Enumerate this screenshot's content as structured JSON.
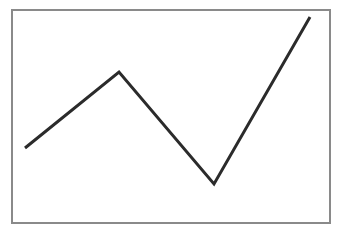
{
  "figure": {
    "title": "",
    "background_color": "#ffffff",
    "width": 343,
    "height": 232,
    "alt_text": "Line chart with a single dark zigzag series rising, falling, then rising sharply inside a thin gray rectangular frame."
  },
  "frame": {
    "name": "plot-border",
    "stroke_color": "#8a8a8a",
    "fill_color": "#ffffff",
    "stroke_width": 2,
    "x": 12,
    "y": 10,
    "width": 318,
    "height": 213
  },
  "series_style": {
    "color": "#2b2b2b",
    "stroke_width": 3
  },
  "chart_data": {
    "type": "line",
    "title": "",
    "xlabel": "",
    "ylabel": "",
    "grid": false,
    "legend": false,
    "xlim": [
      0,
      4
    ],
    "ylim": [
      0,
      10
    ],
    "x": [
      0.4,
      3.4,
      6.4,
      9.4
    ],
    "series": [
      {
        "name": "series-1",
        "color": "#2b2b2b",
        "values": [
          3.5,
          7.1,
          1.8,
          9.7
        ],
        "points": [
          {
            "px": 25,
            "py": 148
          },
          {
            "px": 119,
            "py": 72
          },
          {
            "px": 214,
            "py": 184
          },
          {
            "px": 310,
            "py": 17
          }
        ],
        "polyline": "25,148 119,72 214,184 310,17"
      }
    ],
    "xticks": [],
    "xticklabels": [],
    "yticks": [],
    "yticklabels": [],
    "annotations": []
  }
}
